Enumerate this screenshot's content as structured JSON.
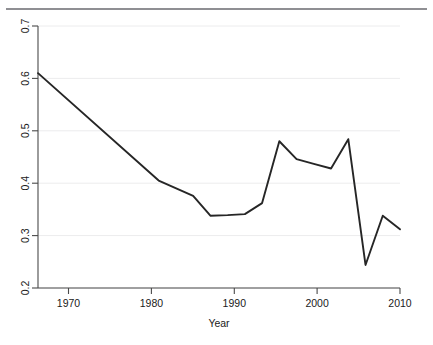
{
  "figure": {
    "background_color": "#ffffff",
    "rule_color": "#8f8f93",
    "line_color": "#262626",
    "grid_color": "#ececed",
    "axis_color": "#4a4a4a"
  },
  "chart_data": {
    "type": "line",
    "title": "",
    "xlabel": "Year",
    "ylabel": "",
    "xlim": [
      1968,
      2010
    ],
    "ylim": [
      0.2,
      0.7
    ],
    "xticks": [
      1970,
      1980,
      1990,
      2000,
      2010
    ],
    "xtick_labels": [
      "1970",
      "1980",
      "1990",
      "2000",
      "2010"
    ],
    "yticks": [
      0.2,
      0.3,
      0.4,
      0.5,
      0.6,
      0.7
    ],
    "ytick_labels": [
      "0.2",
      "0.3",
      "0.4",
      "0.5",
      "0.6",
      "0.7"
    ],
    "grid": true,
    "grid_axis": "y",
    "legend": false,
    "legend_position": "none",
    "series": [
      {
        "name": "series-1",
        "x": [
          1968,
          1982,
          1986,
          1988,
          1990,
          1992,
          1994,
          1996,
          1998,
          2000,
          2002,
          2004,
          2006,
          2008,
          2010
        ],
        "values": [
          0.61,
          0.405,
          0.376,
          0.338,
          0.339,
          0.341,
          0.362,
          0.48,
          0.446,
          0.437,
          0.428,
          0.484,
          0.244,
          0.338,
          0.312
        ]
      }
    ]
  }
}
